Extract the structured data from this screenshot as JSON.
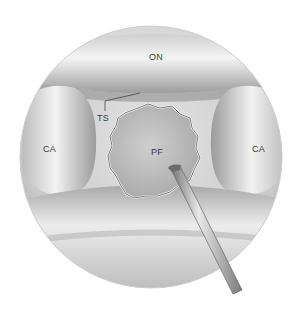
{
  "figure": {
    "labels": {
      "on": "ON",
      "ts": "TS",
      "ca_left": "CA",
      "ca_right": "CA",
      "pf": "PF"
    },
    "colors": {
      "background": "#ffffff",
      "tissue_light": "#f2f2f2",
      "tissue_mid": "#c8c8c8",
      "tissue_dark": "#8a8a8a",
      "opening": "#b9b9b9",
      "label_text": "#3a3a3a"
    }
  }
}
